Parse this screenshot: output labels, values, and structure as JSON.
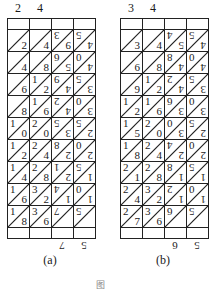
{
  "figures": [
    {
      "id": "a",
      "caption": "(a)",
      "top_labels": [
        "2",
        "4"
      ],
      "bottom_labels": [
        "7",
        "5"
      ],
      "rows": [
        [
          [
            "",
            "2"
          ],
          [
            "",
            "4"
          ],
          [
            "3",
            "9"
          ],
          [
            "5",
            "4"
          ]
        ],
        [
          [
            "",
            "4"
          ],
          [
            "",
            "8"
          ],
          [
            "6",
            "5"
          ],
          [
            "0",
            "4"
          ]
        ],
        [
          [
            "",
            "6"
          ],
          [
            "1",
            "2"
          ],
          [
            "9",
            "4"
          ],
          [
            "5",
            "3"
          ]
        ],
        [
          [
            "",
            "8"
          ],
          [
            "1",
            "6"
          ],
          [
            "2",
            "4"
          ],
          [
            "0",
            "3"
          ]
        ],
        [
          [
            "1",
            "0"
          ],
          [
            "2",
            "0"
          ],
          [
            "5",
            "3"
          ],
          [
            "5",
            "2"
          ]
        ],
        [
          [
            "1",
            "2"
          ],
          [
            "2",
            "4"
          ],
          [
            "8",
            "2"
          ],
          [
            "0",
            "2"
          ]
        ],
        [
          [
            "1",
            "4"
          ],
          [
            "2",
            "8"
          ],
          [
            "1",
            "2"
          ],
          [
            "5",
            "1"
          ]
        ],
        [
          [
            "1",
            "6"
          ],
          [
            "3",
            "2"
          ],
          [
            "4",
            "1"
          ],
          [
            "0",
            "1"
          ]
        ],
        [
          [
            "1",
            "8"
          ],
          [
            "3",
            "6"
          ],
          [
            "7",
            ""
          ],
          [
            "5",
            ""
          ]
        ]
      ]
    },
    {
      "id": "b",
      "caption": "(b)",
      "top_labels": [
        "3",
        "4"
      ],
      "bottom_labels": [
        "6",
        "5"
      ],
      "rows": [
        [
          [
            "",
            "3"
          ],
          [
            "",
            "4"
          ],
          [
            "4",
            "5"
          ],
          [
            "5",
            "4"
          ]
        ],
        [
          [
            "",
            "6"
          ],
          [
            "",
            "8"
          ],
          [
            "8",
            "4"
          ],
          [
            "0",
            "4"
          ]
        ],
        [
          [
            "",
            "9"
          ],
          [
            "1",
            "2"
          ],
          [
            "2",
            "4"
          ],
          [
            "5",
            "3"
          ]
        ],
        [
          [
            "1",
            "2"
          ],
          [
            "1",
            "6"
          ],
          [
            "6",
            "3"
          ],
          [
            "0",
            "3"
          ]
        ],
        [
          [
            "1",
            "5"
          ],
          [
            "2",
            "0"
          ],
          [
            "0",
            "3"
          ],
          [
            "5",
            "2"
          ]
        ],
        [
          [
            "1",
            "8"
          ],
          [
            "2",
            "4"
          ],
          [
            "4",
            "2"
          ],
          [
            "0",
            "2"
          ]
        ],
        [
          [
            "2",
            "1"
          ],
          [
            "2",
            "8"
          ],
          [
            "8",
            "1"
          ],
          [
            "5",
            "1"
          ]
        ],
        [
          [
            "2",
            "4"
          ],
          [
            "3",
            "2"
          ],
          [
            "2",
            "1"
          ],
          [
            "0",
            "1"
          ]
        ],
        [
          [
            "2",
            "7"
          ],
          [
            "3",
            "6"
          ],
          [
            "6",
            ""
          ],
          [
            "5",
            ""
          ]
        ]
      ]
    }
  ],
  "figure_caption": "图"
}
